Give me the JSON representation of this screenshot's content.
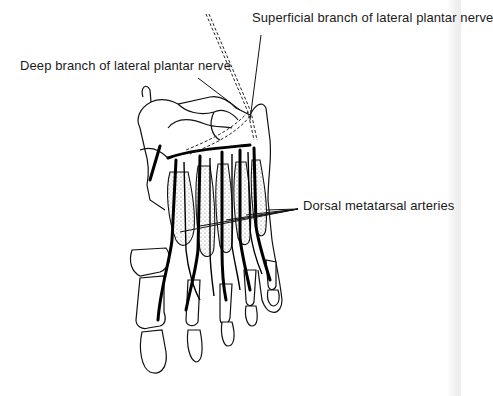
{
  "figure": {
    "labels": {
      "superficial": "Superficial branch of lateral plantar nerve",
      "deep": "Deep branch of lateral plantar nerve",
      "dorsal": "Dorsal metatarsal arteries"
    }
  }
}
